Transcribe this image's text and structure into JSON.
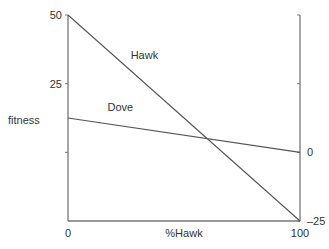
{
  "chart_data": {
    "type": "line",
    "title": "",
    "xlabel": "%Hawk",
    "ylabel": "fitness",
    "xlim": [
      0,
      100
    ],
    "ylim": [
      -25,
      50
    ],
    "grid": false,
    "x_ticks": [
      {
        "value": 0,
        "label": "0"
      },
      {
        "value": 100,
        "label": "100"
      }
    ],
    "left_y_ticks": [
      {
        "value": 50,
        "label": "50"
      },
      {
        "value": 25,
        "label": "25"
      },
      {
        "value": 0,
        "label": ""
      }
    ],
    "right_y_ticks": [
      {
        "value": 50,
        "label": ""
      },
      {
        "value": 25,
        "label": ""
      },
      {
        "value": 0,
        "label": "0"
      },
      {
        "value": -25,
        "label": "-25"
      }
    ],
    "series": [
      {
        "name": "Hawk",
        "x": [
          0,
          100
        ],
        "values": [
          50,
          -25
        ],
        "label_at": [
          27,
          34
        ]
      },
      {
        "name": "Dove",
        "x": [
          0,
          100
        ],
        "values": [
          12.5,
          0
        ],
        "label_at": [
          17,
          15
        ]
      }
    ],
    "annotations": [],
    "colors": {
      "line": "#555555",
      "axis": "#777777",
      "text": "#333333"
    }
  }
}
